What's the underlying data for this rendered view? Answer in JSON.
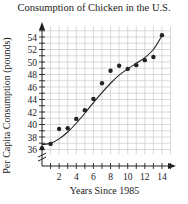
{
  "chart_data": {
    "type": "scatter",
    "title": "Consumption of Chicken in the U.S.",
    "xlabel": "Years Since 1985",
    "ylabel": "Per Capita Consumption (pounds)",
    "x_ticks": [
      2,
      4,
      6,
      8,
      10,
      12,
      14
    ],
    "y_ticks": [
      36,
      38,
      40,
      42,
      44,
      46,
      48,
      50,
      52,
      54
    ],
    "xlim": [
      0,
      15
    ],
    "ylim": [
      35,
      55
    ],
    "grid": true,
    "axis_break_y": true,
    "series": [
      {
        "name": "Observed consumption",
        "style": "points",
        "x": [
          0,
          1,
          2,
          3,
          4,
          5,
          6,
          7,
          8,
          9,
          10,
          11,
          12,
          13,
          14
        ],
        "y": [
          36.2,
          36.9,
          39.3,
          39.4,
          40.9,
          42.3,
          44.1,
          46.6,
          48.6,
          49.4,
          48.9,
          49.5,
          50.3,
          50.8,
          54.3
        ]
      },
      {
        "name": "Cubic fit curve",
        "style": "line",
        "x": [
          0,
          1,
          2,
          3,
          4,
          5,
          6,
          7,
          8,
          9,
          10,
          11,
          12,
          13,
          14
        ],
        "y": [
          36.8,
          37.0,
          37.7,
          38.8,
          40.2,
          41.8,
          43.5,
          45.1,
          46.6,
          47.9,
          48.9,
          49.8,
          50.7,
          52.0,
          54.2
        ]
      }
    ]
  },
  "colors": {
    "axis": "#222222",
    "grid": "#c8c8c8",
    "points": "#222222",
    "curve": "#222222"
  }
}
